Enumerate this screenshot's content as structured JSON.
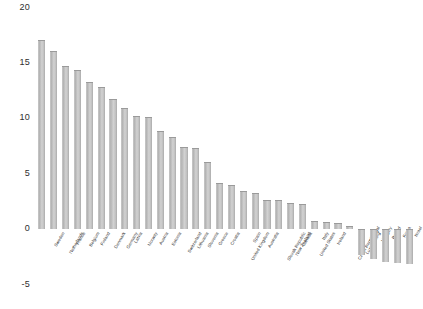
{
  "chart_data": {
    "type": "bar",
    "title": "",
    "subtitle": "",
    "xlabel": "",
    "ylabel": "",
    "ylim": [
      -5,
      20
    ],
    "yticks": [
      20,
      15,
      10,
      5,
      0,
      -5
    ],
    "ytick_labels": [
      "20",
      "15",
      "10",
      "5",
      "0",
      "-5"
    ],
    "grid": false,
    "legend": false,
    "bar_color": "#bdbdbd",
    "categories": [
      "Sweden",
      "Netherlands",
      "France",
      "Belgium",
      "Finland",
      "Denmark",
      "Germany",
      "Latvia",
      "Norway",
      "Austria",
      "Estonia",
      "Switzerland",
      "Lithuania",
      "Slovenia",
      "Greece",
      "Croatia",
      "United Kingdom",
      "Spain",
      "Australia",
      "Slovak Republic",
      "New Zealand",
      "Canada",
      "United States",
      "Italy",
      "Ireland",
      "Czech Republic",
      "Luxembourg",
      "Portugal",
      "Hungary",
      "Poland",
      "Korea",
      "Israel"
    ],
    "values": [
      17.0,
      16.0,
      14.7,
      14.3,
      13.2,
      12.8,
      11.7,
      10.9,
      10.2,
      10.1,
      8.8,
      8.3,
      7.4,
      7.3,
      6.0,
      4.1,
      3.9,
      3.4,
      3.2,
      2.6,
      2.6,
      2.3,
      2.2,
      0.7,
      0.6,
      0.5,
      0.2,
      -2.4,
      -2.7,
      -3.0,
      -3.1,
      -3.2
    ]
  }
}
